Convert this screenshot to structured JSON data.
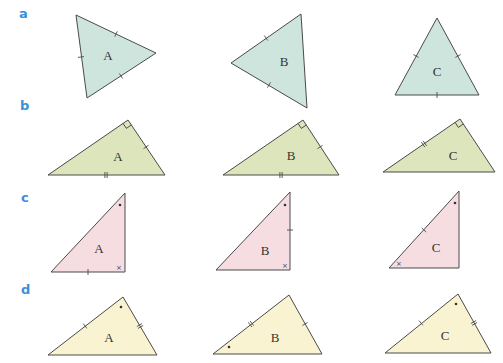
{
  "rows": [
    {
      "label": "a",
      "label_pos": [
        19,
        18
      ],
      "fill": "#cde5dc",
      "triangles": [
        {
          "name": "A",
          "points": [
            [
              76,
              15
            ],
            [
              156,
              53
            ],
            [
              87,
              98
            ]
          ],
          "label_pos": [
            108,
            60
          ],
          "ticks": [
            [
              116,
              34,
              1
            ],
            [
              81,
              57,
              1
            ],
            [
              121,
              76,
              1
            ]
          ],
          "right_angle": null,
          "dots": [],
          "crosses": []
        },
        {
          "name": "B",
          "points": [
            [
              301,
              14
            ],
            [
              231,
              63
            ],
            [
              307,
              108
            ]
          ],
          "label_pos": [
            284,
            66
          ],
          "ticks": [
            [
              266,
              38,
              1
            ],
            [
              269,
              85,
              1
            ]
          ],
          "right_angle": null,
          "dots": [],
          "crosses": []
        },
        {
          "name": "C",
          "points": [
            [
              437,
              18
            ],
            [
              395,
              95
            ],
            [
              479,
              95
            ]
          ],
          "label_pos": [
            437,
            76
          ],
          "ticks": [
            [
              416,
              56,
              1
            ],
            [
              458,
              56,
              1
            ],
            [
              437,
              95,
              1
            ]
          ],
          "right_angle": null,
          "dots": [],
          "crosses": []
        }
      ]
    },
    {
      "label": "b",
      "label_pos": [
        20,
        110
      ],
      "fill": "#dde5bd",
      "triangles": [
        {
          "name": "A",
          "points": [
            [
              48,
              175
            ],
            [
              128,
              120
            ],
            [
              165,
              175
            ]
          ],
          "label_pos": [
            118,
            161
          ],
          "ticks": [
            [
              146,
              147,
              1
            ],
            [
              106,
              175,
              2
            ]
          ],
          "right_angle": [
            128,
            120
          ],
          "dots": [],
          "crosses": []
        },
        {
          "name": "B",
          "points": [
            [
              223,
              175
            ],
            [
              303,
              120
            ],
            [
              339,
              175
            ]
          ],
          "label_pos": [
            291,
            160
          ],
          "ticks": [
            [
              320,
              147,
              1
            ],
            [
              281,
              175,
              2
            ]
          ],
          "right_angle": [
            303,
            120
          ],
          "dots": [],
          "crosses": []
        },
        {
          "name": "C",
          "points": [
            [
              383,
              172
            ],
            [
              460,
              119
            ],
            [
              495,
              172
            ]
          ],
          "label_pos": [
            453,
            160
          ],
          "ticks": [
            [
              424,
              144,
              2
            ]
          ],
          "right_angle": [
            460,
            119
          ],
          "dots": [],
          "crosses": []
        }
      ]
    },
    {
      "label": "c",
      "label_pos": [
        21,
        202
      ],
      "fill": "#f5dde2",
      "triangles": [
        {
          "name": "A",
          "points": [
            [
              51,
              272
            ],
            [
              125,
              193
            ],
            [
              125,
              272
            ]
          ],
          "label_pos": [
            99,
            253
          ],
          "ticks": [
            [
              88,
              272,
              1
            ]
          ],
          "right_angle": null,
          "dots": [
            [
              120,
              205
            ]
          ],
          "crosses": [
            [
              119,
              267
            ]
          ]
        },
        {
          "name": "B",
          "points": [
            [
              216,
              270
            ],
            [
              290,
              192
            ],
            [
              290,
              270
            ]
          ],
          "label_pos": [
            265,
            255
          ],
          "ticks": [
            [
              290,
              230,
              1
            ]
          ],
          "right_angle": null,
          "dots": [
            [
              285,
              205
            ]
          ],
          "crosses": [
            [
              285,
              265
            ]
          ]
        },
        {
          "name": "C",
          "points": [
            [
              389,
              268
            ],
            [
              459,
              191
            ],
            [
              459,
              268
            ]
          ],
          "label_pos": [
            436,
            252
          ],
          "ticks": [
            [
              424,
              230,
              1
            ]
          ],
          "right_angle": null,
          "dots": [
            [
              455,
              203
            ]
          ],
          "crosses": [
            [
              399,
              263
            ]
          ]
        }
      ]
    },
    {
      "label": "d",
      "label_pos": [
        21,
        294
      ],
      "fill": "#faf3d2",
      "triangles": [
        {
          "name": "A",
          "points": [
            [
              48,
              355
            ],
            [
              123,
              297
            ],
            [
              157,
              355
            ]
          ],
          "label_pos": [
            109,
            342
          ],
          "ticks": [
            [
              85,
              326,
              1
            ],
            [
              140,
              326,
              2
            ]
          ],
          "right_angle": null,
          "dots": [
            [
              121,
              307
            ]
          ],
          "crosses": []
        },
        {
          "name": "B",
          "points": [
            [
              213,
              354
            ],
            [
              289,
              295
            ],
            [
              322,
              354
            ]
          ],
          "label_pos": [
            275,
            342
          ],
          "ticks": [
            [
              251,
              324,
              2
            ],
            [
              305,
              324,
              1
            ]
          ],
          "right_angle": null,
          "dots": [
            [
              229,
              347
            ]
          ],
          "crosses": []
        },
        {
          "name": "C",
          "points": [
            [
              385,
              353
            ],
            [
              458,
              294
            ],
            [
              491,
              353
            ]
          ],
          "label_pos": [
            445,
            340
          ],
          "ticks": [
            [
              421,
              323,
              1
            ],
            [
              474,
              323,
              2
            ]
          ],
          "right_angle": null,
          "dots": [
            [
              456,
              304
            ]
          ],
          "crosses": []
        }
      ]
    }
  ]
}
